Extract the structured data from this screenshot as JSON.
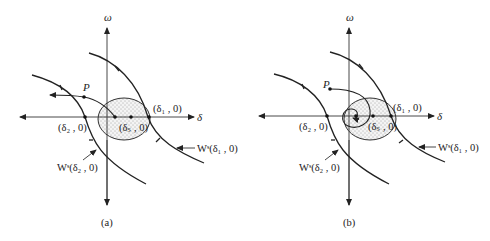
{
  "figure": {
    "panels": [
      {
        "id": "a",
        "caption": "(a)",
        "axis_x_label": "δ",
        "axis_y_label": "ω",
        "point_P": "P",
        "eq_d1": "(δ₁ , 0)",
        "eq_d2": "(δ₂ , 0)",
        "eq_ds": "(δₛ , 0)",
        "manifold_d1": "Wˢ(δ₁ , 0)",
        "manifold_d2": "Wˢ(δ₂ , 0)",
        "trajectory": "from P escapes leftward out of region"
      },
      {
        "id": "b",
        "caption": "(b)",
        "axis_x_label": "δ",
        "axis_y_label": "ω",
        "point_P": "P",
        "eq_d1": "(δ₁ , 0)",
        "eq_d2": "(δ₂ , 0)",
        "eq_ds": "(δₛ , 0)",
        "manifold_d1": "Wˢ(δ₁ , 0)",
        "manifold_d2": "Wˢ(δ₂ , 0)",
        "trajectory": "from P spirals into stable equilibrium"
      }
    ],
    "colors": {
      "ink": "#222222",
      "background": "#ffffff"
    }
  }
}
